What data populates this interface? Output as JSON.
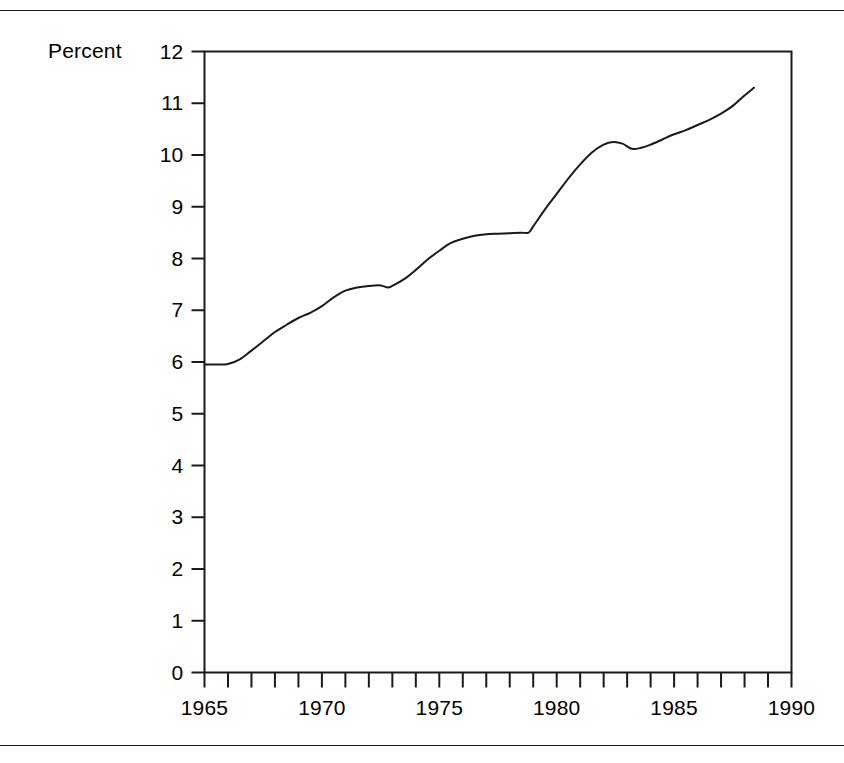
{
  "chart_data": {
    "type": "line",
    "title": "",
    "subtitle": "",
    "xlabel": "",
    "ylabel": "Percent",
    "ylabel_position": "top-left-beside-max-tick",
    "grid": false,
    "legend": null,
    "legend_position": "none",
    "xlim": [
      1965,
      1990
    ],
    "ylim": [
      0,
      12
    ],
    "yticks": [
      0,
      1,
      2,
      3,
      4,
      5,
      6,
      7,
      8,
      9,
      10,
      11,
      12
    ],
    "ytick_labels": [
      "0",
      "1",
      "2",
      "3",
      "4",
      "5",
      "6",
      "7",
      "8",
      "9",
      "10",
      "11",
      "12"
    ],
    "xticks": [
      1965,
      1970,
      1975,
      1980,
      1985,
      1990
    ],
    "xtick_labels": [
      "1965",
      "1970",
      "1975",
      "1980",
      "1985",
      "1990"
    ],
    "x_minor_tick_interval": 1,
    "x_minor_ticks": [
      1965,
      1966,
      1967,
      1968,
      1969,
      1970,
      1971,
      1972,
      1973,
      1974,
      1975,
      1976,
      1977,
      1978,
      1979,
      1980,
      1981,
      1982,
      1983,
      1984,
      1985,
      1986,
      1987,
      1988,
      1989,
      1990
    ],
    "series": [
      {
        "name": "Percent",
        "color": "#1a1a1a",
        "line_width": 2,
        "x": [
          1965.0,
          1965.5,
          1966.0,
          1966.5,
          1967.0,
          1967.5,
          1968.0,
          1968.5,
          1969.0,
          1969.5,
          1970.0,
          1970.5,
          1971.0,
          1971.5,
          1972.0,
          1972.5,
          1972.8,
          1973.0,
          1973.5,
          1974.0,
          1974.5,
          1975.0,
          1975.5,
          1976.0,
          1976.5,
          1977.0,
          1977.5,
          1978.0,
          1978.5,
          1978.8,
          1979.0,
          1979.5,
          1980.0,
          1980.5,
          1981.0,
          1981.5,
          1982.0,
          1982.4,
          1982.8,
          1983.2,
          1983.6,
          1984.0,
          1984.5,
          1985.0,
          1985.5,
          1986.0,
          1986.5,
          1987.0,
          1987.5,
          1988.0,
          1988.4
        ],
        "y": [
          5.95,
          5.95,
          5.96,
          6.05,
          6.22,
          6.4,
          6.58,
          6.72,
          6.85,
          6.95,
          7.08,
          7.25,
          7.38,
          7.44,
          7.47,
          7.48,
          7.44,
          7.47,
          7.6,
          7.78,
          7.98,
          8.15,
          8.3,
          8.38,
          8.44,
          8.47,
          8.48,
          8.49,
          8.5,
          8.5,
          8.62,
          8.95,
          9.25,
          9.55,
          9.82,
          10.05,
          10.2,
          10.25,
          10.22,
          10.12,
          10.14,
          10.2,
          10.3,
          10.4,
          10.48,
          10.58,
          10.68,
          10.8,
          10.95,
          11.15,
          11.3
        ]
      }
    ]
  },
  "figure": {
    "rules": {
      "top": "horizontal-rule",
      "bottom": "horizontal-rule"
    }
  }
}
